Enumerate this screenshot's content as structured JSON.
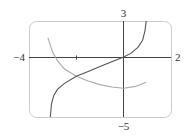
{
  "chart_data": {
    "type": "line",
    "title": "",
    "xlabel": "",
    "ylabel": "",
    "xlim": [
      -4,
      2
    ],
    "ylim": [
      -5,
      3
    ],
    "grid": false,
    "legend": null,
    "tick_labels": {
      "x_min": "−4",
      "x_max": "2",
      "y_max": "3",
      "y_min": "−5"
    },
    "x_ticks": [
      -2
    ],
    "series": [
      {
        "name": "dark curve (increasing, vertical asymptotes near x=-3.1 and x=1)",
        "color": "#555555",
        "points": [
          [
            -3.1,
            -5.0
          ],
          [
            -3.05,
            -3.9
          ],
          [
            -2.95,
            -3.2
          ],
          [
            -2.8,
            -2.7
          ],
          [
            -2.5,
            -2.2
          ],
          [
            -2.0,
            -1.6
          ],
          [
            -1.5,
            -1.2
          ],
          [
            -1.0,
            -0.8
          ],
          [
            -0.5,
            -0.4
          ],
          [
            0.0,
            0.0
          ],
          [
            0.3,
            0.3
          ],
          [
            0.6,
            0.8
          ],
          [
            0.8,
            1.4
          ],
          [
            0.9,
            2.2
          ],
          [
            0.95,
            3.0
          ]
        ]
      },
      {
        "name": "light curve (decreasing then slightly increasing, minimum near x=0)",
        "color": "#aaaaaa",
        "points": [
          [
            -3.2,
            1.6
          ],
          [
            -3.0,
            0.4
          ],
          [
            -2.8,
            -0.3
          ],
          [
            -2.5,
            -1.0
          ],
          [
            -2.0,
            -1.6
          ],
          [
            -1.5,
            -2.0
          ],
          [
            -1.0,
            -2.3
          ],
          [
            -0.5,
            -2.5
          ],
          [
            0.0,
            -2.6
          ],
          [
            0.5,
            -2.45
          ],
          [
            0.95,
            -2.1
          ]
        ]
      }
    ]
  },
  "axes": {
    "x_left_label": "−4",
    "x_right_label": "2",
    "y_top_label": "3",
    "y_bottom_label": "−5"
  },
  "colors": {
    "frame": "#cccccc",
    "axes": "#444444",
    "dark_curve": "#555555",
    "light_curve": "#aaaaaa"
  }
}
